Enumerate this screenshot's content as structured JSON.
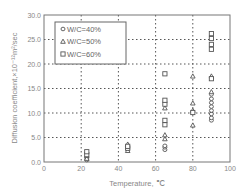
{
  "chart_data": {
    "type": "scatter",
    "title": "",
    "xlabel": "Temperature, ℃",
    "ylabel": "Diffusion coefficient,×10⁻¹²m²/sec",
    "xlim": [
      0,
      100
    ],
    "ylim": [
      0,
      30
    ],
    "xticks": [
      "0",
      "20",
      "40",
      "60",
      "80",
      "100"
    ],
    "yticks": [
      "0.0",
      "5.0",
      "10.0",
      "15.0",
      "20.0",
      "25.0",
      "30.0"
    ],
    "grid": true,
    "legend_position": "upper-left",
    "series": [
      {
        "name": "W/C=40%",
        "marker": "circle",
        "points": [
          [
            23,
            0.4
          ],
          [
            23,
            0.8
          ],
          [
            45,
            2.6
          ],
          [
            45,
            2.9
          ],
          [
            65,
            2.5
          ],
          [
            65,
            3.0
          ],
          [
            65,
            3.3
          ],
          [
            90,
            8.5
          ],
          [
            90,
            9.0
          ],
          [
            90,
            9.8
          ],
          [
            90,
            10.5
          ],
          [
            90,
            11.3
          ],
          [
            90,
            12.1
          ],
          [
            90,
            12.9
          ],
          [
            90,
            13.8
          ]
        ]
      },
      {
        "name": "W/C=50%",
        "marker": "triangle",
        "points": [
          [
            23,
            0.7
          ],
          [
            23,
            1.3
          ],
          [
            45,
            2.3
          ],
          [
            45,
            3.6
          ],
          [
            65,
            4.7
          ],
          [
            65,
            5.5
          ],
          [
            65,
            11.0
          ],
          [
            80,
            7.5
          ],
          [
            80,
            10.5
          ],
          [
            80,
            12.0
          ],
          [
            80,
            17.5
          ],
          [
            90,
            14.3
          ],
          [
            90,
            17.5
          ]
        ]
      },
      {
        "name": "W/C=60%",
        "marker": "square",
        "points": [
          [
            23,
            1.5
          ],
          [
            23,
            2.1
          ],
          [
            45,
            2.8
          ],
          [
            45,
            3.2
          ],
          [
            65,
            7.6
          ],
          [
            65,
            8.5
          ],
          [
            65,
            11.8
          ],
          [
            65,
            12.6
          ],
          [
            65,
            18.0
          ],
          [
            80,
            10.1
          ],
          [
            90,
            17.0
          ],
          [
            90,
            23.0
          ],
          [
            90,
            24.0
          ],
          [
            90,
            25.2
          ],
          [
            90,
            26.2
          ]
        ]
      }
    ]
  }
}
